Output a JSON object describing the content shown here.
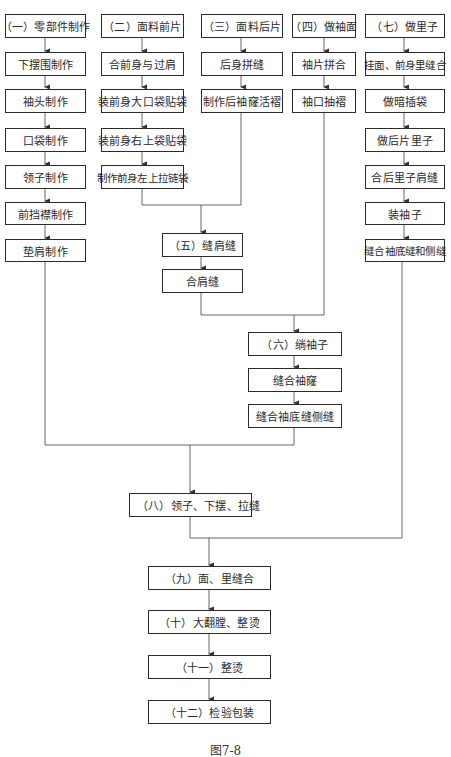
{
  "figure": {
    "caption": "图7-8",
    "columns": [
      {
        "title": "（一）零部件制作",
        "steps": [
          "下摆围制作",
          "袖头制作",
          "口袋制作",
          "领子制作",
          "前挡襟制作",
          "垫肩制作"
        ]
      },
      {
        "title": "（二）面料前片",
        "steps": [
          "合前身与过肩",
          "装前身大口袋贴袋",
          "装前身右上袋贴袋",
          "制作前身左上拉链袋"
        ]
      },
      {
        "title": "（三）面料后片",
        "steps": [
          "后身拼缝",
          "制作后袖窿活褶"
        ]
      },
      {
        "title": "（四）做袖面",
        "steps": [
          "袖片拼合",
          "袖口抽褶"
        ]
      },
      {
        "title": "（七）做里子",
        "steps": [
          "挂面、前身里缝合",
          "做暗插袋",
          "做后片里子",
          "合后里子肩缝",
          "装袖子",
          "缝合袖底缝和侧缝"
        ]
      }
    ],
    "merge_five": {
      "title": "（五）缝肩缝",
      "steps": [
        "合肩缝"
      ]
    },
    "merge_six": {
      "title": "（六）绱袖子",
      "steps": [
        "缝合袖窿",
        "缝合袖底缝侧缝"
      ]
    },
    "final_steps": [
      "（八）领子、下摆、拉缝",
      "（九）面、里缝合",
      "（十）大翻膛、整烫",
      "（十一）整烫",
      "（十二）检验包装"
    ]
  }
}
